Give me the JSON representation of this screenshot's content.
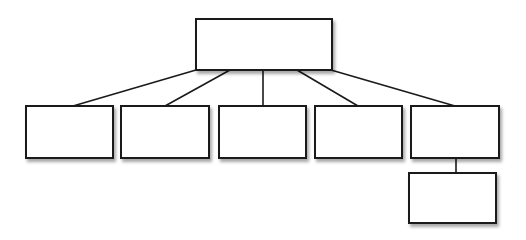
{
  "diagram": {
    "type": "org-chart",
    "colors": {
      "stroke": "#1a1a1a",
      "fill": "#ffffff",
      "background": "#ffffff"
    },
    "nodes": [
      {
        "id": "root",
        "label": "",
        "x": 195,
        "y": 18,
        "w": 138,
        "h": 53
      },
      {
        "id": "child-1",
        "label": "",
        "x": 25,
        "y": 105,
        "w": 89,
        "h": 54
      },
      {
        "id": "child-2",
        "label": "",
        "x": 120,
        "y": 105,
        "w": 90,
        "h": 54
      },
      {
        "id": "child-3",
        "label": "",
        "x": 218,
        "y": 105,
        "w": 89,
        "h": 54
      },
      {
        "id": "child-4",
        "label": "",
        "x": 314,
        "y": 105,
        "w": 89,
        "h": 54
      },
      {
        "id": "child-5",
        "label": "",
        "x": 410,
        "y": 105,
        "w": 90,
        "h": 54
      },
      {
        "id": "grandchild-1",
        "label": "",
        "x": 408,
        "y": 172,
        "w": 89,
        "h": 52
      }
    ],
    "edges": [
      {
        "from": "root",
        "to": "child-1",
        "x1": 196,
        "y1": 70,
        "x2": 73,
        "y2": 106
      },
      {
        "from": "root",
        "to": "child-2",
        "x1": 230,
        "y1": 70,
        "x2": 165,
        "y2": 106
      },
      {
        "from": "root",
        "to": "child-3",
        "x1": 263,
        "y1": 70,
        "x2": 263,
        "y2": 106
      },
      {
        "from": "root",
        "to": "child-4",
        "x1": 297,
        "y1": 70,
        "x2": 358,
        "y2": 106
      },
      {
        "from": "root",
        "to": "child-5",
        "x1": 331,
        "y1": 70,
        "x2": 455,
        "y2": 106
      },
      {
        "from": "child-5",
        "to": "grandchild-1",
        "x1": 456,
        "y1": 158,
        "x2": 456,
        "y2": 173
      }
    ]
  }
}
